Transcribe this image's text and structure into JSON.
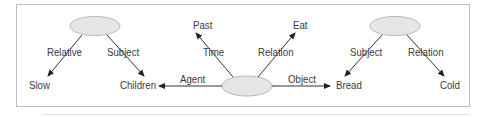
{
  "diagram": {
    "type": "semantic-network",
    "nodes": {
      "center_event": {
        "shape": "ellipse",
        "label": ""
      },
      "left_concept": {
        "shape": "ellipse",
        "label": ""
      },
      "right_concept": {
        "shape": "ellipse",
        "label": ""
      },
      "past": {
        "label": "Past"
      },
      "eat": {
        "label": "Eat"
      },
      "children": {
        "label": "Children"
      },
      "bread": {
        "label": "Bread"
      },
      "slow": {
        "label": "Slow"
      },
      "cold": {
        "label": "Cold"
      }
    },
    "edges": {
      "time": {
        "from": "center_event",
        "to": "past",
        "label": "Time"
      },
      "relation_eat": {
        "from": "center_event",
        "to": "eat",
        "label": "Relation"
      },
      "agent": {
        "from": "center_event",
        "to": "children",
        "label": "Agent"
      },
      "object": {
        "from": "center_event",
        "to": "bread",
        "label": "Object"
      },
      "left_relative": {
        "from": "left_concept",
        "to": "slow",
        "label": "Relative"
      },
      "left_subject": {
        "from": "left_concept",
        "to": "children",
        "label": "Subject"
      },
      "right_subject": {
        "from": "right_concept",
        "to": "bread",
        "label": "Subject"
      },
      "right_relation": {
        "from": "right_concept",
        "to": "cold",
        "label": "Relation"
      }
    },
    "colors": {
      "ellipse_fill": "#e6e6e6",
      "ellipse_stroke": "#b8b8b8",
      "edge": "#333333",
      "text": "#3a3a3a",
      "frame_border": "#bdbdbd"
    }
  }
}
